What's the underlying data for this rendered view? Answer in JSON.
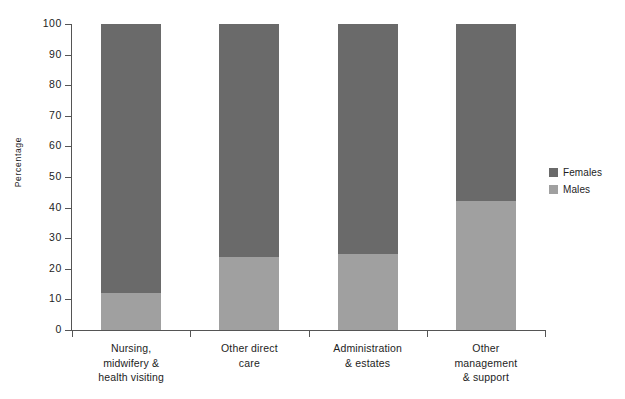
{
  "chart_data": {
    "type": "bar",
    "subtype": "stacked-bar-100",
    "title": "",
    "xlabel": "",
    "ylabel": "Percentage",
    "ylim": [
      0,
      100
    ],
    "yticks": [
      0,
      10,
      20,
      30,
      40,
      50,
      60,
      70,
      80,
      90,
      100
    ],
    "ytick_labels": [
      "0",
      "10",
      "20",
      "30",
      "40",
      "50",
      "60",
      "70",
      "80",
      "90",
      "100"
    ],
    "grid": false,
    "legend_position": "right",
    "categories": [
      "Nursing, midwifery & health visiting",
      "Other direct care",
      "Administration & estates",
      "Other management & support"
    ],
    "category_lines": [
      [
        "Nursing,",
        "midwifery &",
        "health visiting"
      ],
      [
        "Other direct",
        "care"
      ],
      [
        "Administration",
        "& estates"
      ],
      [
        "Other",
        "management",
        "& support"
      ]
    ],
    "series": [
      {
        "name": "Females",
        "color": "#6a6a6a",
        "values": [
          88,
          76,
          75,
          58
        ]
      },
      {
        "name": "Males",
        "color": "#a0a0a0",
        "values": [
          12,
          24,
          25,
          42
        ]
      }
    ],
    "stack_order": [
      "Males",
      "Females"
    ]
  },
  "legend": {
    "items": [
      {
        "label": "Females",
        "color": "#6a6a6a"
      },
      {
        "label": "Males",
        "color": "#a0a0a0"
      }
    ]
  }
}
